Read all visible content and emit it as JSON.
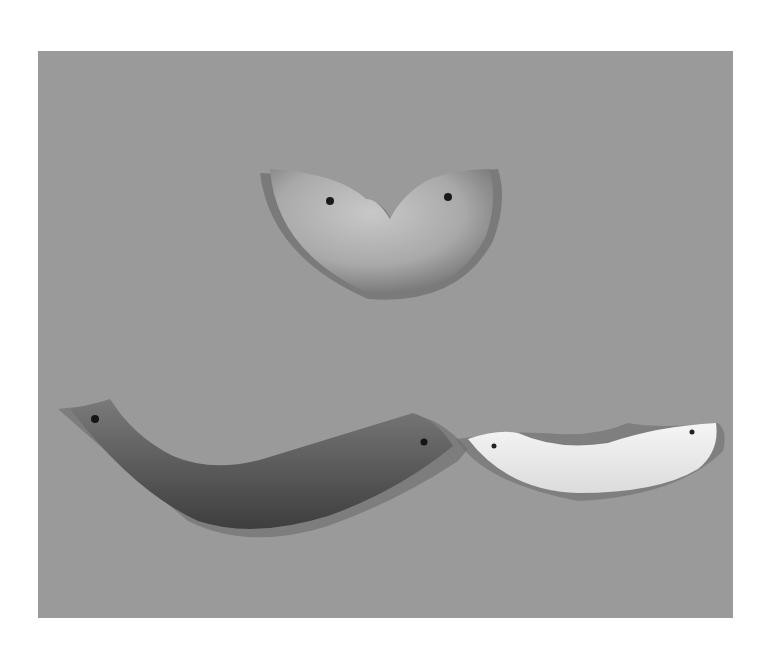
{
  "image": {
    "description": "Photograph of three carved stone/jade pendant ornaments on a gray background",
    "background_color": "#9a9a9a",
    "page_color": "#ffffff",
    "objects": [
      {
        "name": "top-pendant",
        "shape": "crescent with central notch",
        "holes": 2,
        "tone": "#b8b8b8"
      },
      {
        "name": "bottom-left-pendant",
        "shape": "long curved arc",
        "holes": 2,
        "tone": "#555555"
      },
      {
        "name": "bottom-right-pendant",
        "shape": "curved arc",
        "holes": 2,
        "tone": "#ededed"
      }
    ]
  }
}
